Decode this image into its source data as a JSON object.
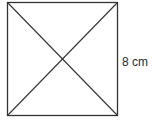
{
  "diagram": {
    "shape": "square",
    "side_label": "8 cm",
    "diagonals": 2,
    "stroke_color": "#333333"
  }
}
